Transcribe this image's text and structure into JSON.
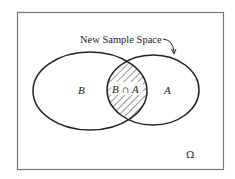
{
  "diagram": {
    "type": "venn",
    "frame_label": "Ω",
    "annotation": "New Sample Space",
    "sets": [
      {
        "name": "B",
        "label": "B"
      },
      {
        "name": "A",
        "label": "A"
      }
    ],
    "intersection": {
      "label": "B ∩ A",
      "shaded": true,
      "pattern": "diagonal-hatch"
    },
    "colors": {
      "stroke": "#222222",
      "frame": "#666666",
      "background": "#ffffff"
    }
  }
}
